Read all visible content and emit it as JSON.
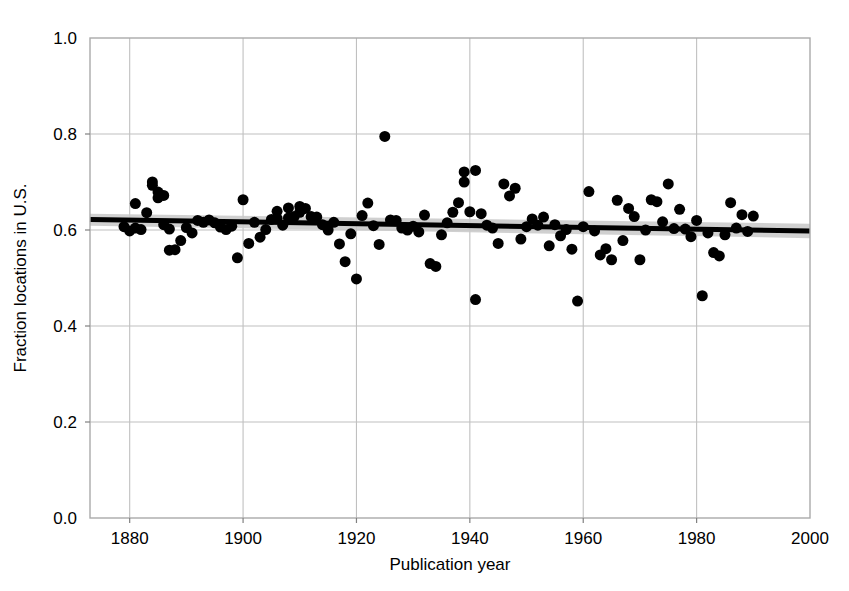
{
  "chart_data": {
    "type": "scatter",
    "title": "",
    "xlabel": "Publication year",
    "ylabel": "Fraction locations in U.S.",
    "xlim": [
      1873,
      2000
    ],
    "ylim": [
      0.0,
      1.0
    ],
    "xticks": [
      1880,
      1900,
      1920,
      1940,
      1960,
      1980,
      2000
    ],
    "xtick_labels": [
      "1880",
      "1900",
      "1920",
      "1940",
      "1960",
      "1980",
      "2000"
    ],
    "yticks": [
      0.0,
      0.2,
      0.4,
      0.6,
      0.8,
      1.0
    ],
    "ytick_labels": [
      "0.0",
      "0.2",
      "0.4",
      "0.6",
      "0.8",
      "1.0"
    ],
    "grid": true,
    "legend": "none",
    "marker": {
      "shape": "circle",
      "color": "#000000",
      "size_px": 11
    },
    "series": [
      {
        "name": "Publications",
        "x": [
          1879,
          1880,
          1881,
          1881,
          1882,
          1883,
          1884,
          1884,
          1885,
          1885,
          1886,
          1886,
          1887,
          1887,
          1888,
          1889,
          1890,
          1891,
          1892,
          1893,
          1894,
          1895,
          1896,
          1897,
          1898,
          1899,
          1900,
          1901,
          1902,
          1903,
          1904,
          1905,
          1906,
          1906,
          1907,
          1908,
          1908,
          1909,
          1910,
          1910,
          1911,
          1912,
          1913,
          1914,
          1915,
          1916,
          1917,
          1918,
          1919,
          1920,
          1921,
          1922,
          1923,
          1924,
          1925,
          1926,
          1927,
          1928,
          1929,
          1930,
          1931,
          1932,
          1933,
          1934,
          1935,
          1936,
          1937,
          1938,
          1939,
          1939,
          1940,
          1941,
          1941,
          1942,
          1943,
          1944,
          1945,
          1946,
          1947,
          1948,
          1949,
          1950,
          1951,
          1952,
          1953,
          1954,
          1955,
          1956,
          1957,
          1958,
          1959,
          1960,
          1961,
          1962,
          1963,
          1964,
          1965,
          1966,
          1967,
          1968,
          1969,
          1970,
          1971,
          1972,
          1973,
          1974,
          1975,
          1976,
          1977,
          1978,
          1979,
          1980,
          1981,
          1982,
          1983,
          1984,
          1985,
          1986,
          1987,
          1988,
          1989,
          1990
        ],
        "y": [
          0.607,
          0.598,
          0.604,
          0.655,
          0.601,
          0.636,
          0.7,
          0.693,
          0.667,
          0.679,
          0.672,
          0.611,
          0.602,
          0.558,
          0.559,
          0.578,
          0.605,
          0.594,
          0.62,
          0.616,
          0.621,
          0.615,
          0.606,
          0.601,
          0.608,
          0.542,
          0.663,
          0.572,
          0.616,
          0.585,
          0.601,
          0.622,
          0.639,
          0.624,
          0.61,
          0.646,
          0.625,
          0.628,
          0.649,
          0.637,
          0.645,
          0.628,
          0.627,
          0.611,
          0.6,
          0.616,
          0.571,
          0.534,
          0.592,
          0.498,
          0.63,
          0.656,
          0.609,
          0.57,
          0.795,
          0.621,
          0.62,
          0.604,
          0.6,
          0.608,
          0.596,
          0.631,
          0.53,
          0.524,
          0.59,
          0.615,
          0.637,
          0.657,
          0.721,
          0.7,
          0.638,
          0.724,
          0.455,
          0.634,
          0.61,
          0.604,
          0.572,
          0.696,
          0.671,
          0.687,
          0.581,
          0.607,
          0.623,
          0.61,
          0.627,
          0.567,
          0.611,
          0.588,
          0.601,
          0.56,
          0.452,
          0.607,
          0.68,
          0.598,
          0.548,
          0.561,
          0.538,
          0.662,
          0.578,
          0.645,
          0.628,
          0.538,
          0.6,
          0.663,
          0.659,
          0.617,
          0.696,
          0.603,
          0.643,
          0.602,
          0.586,
          0.62,
          0.463,
          0.594,
          0.553,
          0.546,
          0.59,
          0.657,
          0.604,
          0.632,
          0.597,
          0.629
        ],
        "marker": "circle",
        "color": "#000000"
      }
    ],
    "trend_line": {
      "name": "Linear fit",
      "color": "#000000",
      "width_px": 5,
      "x_start": 1873,
      "x_end": 2000,
      "y_start": 0.622,
      "y_end": 0.598
    },
    "confidence_band": {
      "name": "Confidence interval",
      "color": "#c8c8c8",
      "x_start": 1873,
      "x_end": 2000,
      "upper_start": 0.634,
      "upper_end": 0.613,
      "lower_start": 0.609,
      "lower_end": 0.583
    },
    "annotations": [],
    "frame": {
      "color": "#aaaaaa",
      "grid_color": "#c0c0c0"
    }
  },
  "axes": {
    "x_title": "Publication year",
    "y_title": "Fraction locations in U.S."
  }
}
